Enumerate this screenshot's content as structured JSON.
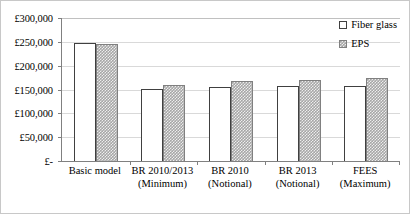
{
  "chart_data": {
    "type": "bar",
    "title": "",
    "xlabel": "",
    "ylabel": "",
    "ylim": [
      0,
      300000
    ],
    "ytick_values": [
      0,
      50000,
      100000,
      150000,
      200000,
      250000,
      300000
    ],
    "ytick_labels": [
      "£-",
      "£50,000",
      "£100,000",
      "£150,000",
      "£200,000",
      "£250,000",
      "£300,000"
    ],
    "grid": true,
    "legend_position": "top-right",
    "categories": [
      "Basic model",
      "BR 2010/2013 (Minimum)",
      "BR 2010 (Notional)",
      "BR 2013 (Notional)",
      "FEES (Maximum)"
    ],
    "category_lines": [
      {
        "line1": "Basic model",
        "line2": ""
      },
      {
        "line1": "BR 2010/2013",
        "line2": "(Minimum)"
      },
      {
        "line1": "BR 2010",
        "line2": "(Notional)"
      },
      {
        "line1": "BR 2013",
        "line2": "(Notional)"
      },
      {
        "line1": "FEES",
        "line2": "(Maximum)"
      }
    ],
    "series": [
      {
        "name": "Fiber glass",
        "swatch": "hollow-white",
        "values": [
          247500,
          151500,
          155500,
          156500,
          158000
        ]
      },
      {
        "name": "EPS",
        "swatch": "gray-dotted",
        "values": [
          246000,
          160000,
          167000,
          171000,
          173500
        ]
      }
    ]
  },
  "legend": {
    "entries": [
      {
        "label": "Fiber glass"
      },
      {
        "label": "EPS"
      }
    ]
  }
}
